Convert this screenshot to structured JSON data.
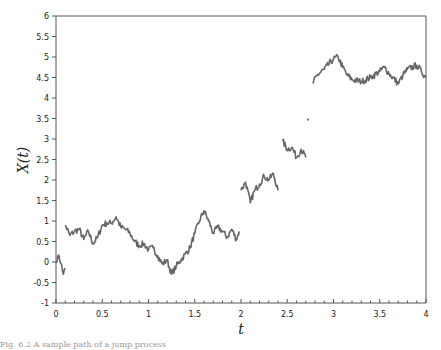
{
  "chart_data": {
    "type": "line",
    "title": "",
    "xlabel": "t",
    "ylabel": "X(t)",
    "xlim": [
      0,
      4
    ],
    "ylim": [
      -1,
      6
    ],
    "grid": false,
    "legend": null,
    "x_ticks": [
      "0",
      "0.5",
      "1",
      "1.5",
      "2",
      "2.5",
      "3",
      "3.5",
      "4"
    ],
    "y_ticks": [
      "-1",
      "-0.5",
      "0",
      "0.5",
      "1",
      "1.5",
      "2",
      "2.5",
      "3",
      "3.5",
      "4",
      "4.5",
      "5",
      "5.5",
      "6"
    ],
    "line_color": "#666666",
    "series": [
      {
        "name": "segment-1",
        "x": [
          0.0,
          0.02,
          0.04,
          0.06,
          0.08,
          0.1
        ],
        "y": [
          0.0,
          0.15,
          0.05,
          -0.05,
          -0.3,
          -0.15
        ]
      },
      {
        "name": "segment-2",
        "x": [
          0.1,
          0.15,
          0.2,
          0.25,
          0.3,
          0.35,
          0.4,
          0.45,
          0.5,
          0.55,
          0.6,
          0.65,
          0.7,
          0.75,
          0.8,
          0.85,
          0.9,
          0.95,
          1.0,
          1.05,
          1.1,
          1.15,
          1.2,
          1.25,
          1.3,
          1.35,
          1.4,
          1.45,
          1.5,
          1.55,
          1.6,
          1.65,
          1.7,
          1.75,
          1.8,
          1.85,
          1.9,
          1.95,
          1.98
        ],
        "y": [
          0.9,
          0.65,
          0.75,
          0.8,
          0.55,
          0.75,
          0.45,
          0.6,
          0.9,
          0.95,
          0.95,
          1.1,
          0.85,
          0.8,
          0.7,
          0.5,
          0.4,
          0.45,
          0.3,
          0.35,
          0.15,
          -0.05,
          0.05,
          -0.3,
          -0.1,
          0.05,
          0.2,
          0.35,
          0.7,
          1.0,
          1.25,
          1.0,
          0.7,
          0.85,
          0.75,
          0.6,
          0.8,
          0.55,
          0.75
        ]
      },
      {
        "name": "segment-3",
        "x": [
          2.0,
          2.05,
          2.1,
          2.15,
          2.2,
          2.25,
          2.3,
          2.35,
          2.4
        ],
        "y": [
          1.75,
          1.95,
          1.45,
          1.75,
          1.9,
          2.1,
          2.0,
          2.15,
          1.75
        ]
      },
      {
        "name": "segment-4",
        "x": [
          2.45,
          2.5,
          2.55,
          2.6,
          2.65,
          2.7
        ],
        "y": [
          2.95,
          2.75,
          2.8,
          2.55,
          2.75,
          2.55
        ]
      },
      {
        "name": "segment-5",
        "x": [
          2.72,
          2.73
        ],
        "y": [
          3.5,
          3.45
        ]
      },
      {
        "name": "segment-6",
        "x": [
          2.78,
          2.82,
          2.9,
          3.0,
          3.05,
          3.1,
          3.15,
          3.2,
          3.3,
          3.4,
          3.5,
          3.55,
          3.6,
          3.7,
          3.75,
          3.8,
          3.9,
          3.95,
          4.0
        ],
        "y": [
          4.35,
          4.55,
          4.7,
          4.95,
          5.0,
          4.75,
          4.55,
          4.45,
          4.4,
          4.5,
          4.65,
          4.75,
          4.6,
          4.35,
          4.55,
          4.7,
          4.8,
          4.65,
          4.5
        ]
      }
    ]
  },
  "caption": {
    "text": "Fig. 6.2  A sample path of a jump process"
  }
}
